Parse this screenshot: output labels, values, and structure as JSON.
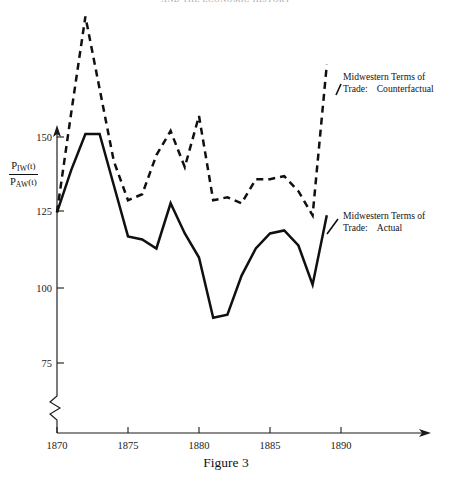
{
  "page": {
    "running_head": "AND THE ECONOMIC HISTORY",
    "caption": "Figure 3"
  },
  "axes": {
    "y_label_numerator_base": "P",
    "y_label_numerator_sub": "IW",
    "y_label_numerator_arg": "(t)",
    "y_label_denominator_base": "P",
    "y_label_denominator_sub": "AW",
    "y_label_denominator_arg": "(t)",
    "y_ticks": [
      150,
      125,
      100,
      75
    ],
    "y_tick_labels": [
      "150",
      "125",
      "100",
      "75"
    ],
    "x_ticks": [
      1870,
      1875,
      1880,
      1885,
      1890
    ],
    "x_tick_labels": [
      "1870",
      "1875",
      "1880",
      "1885",
      "1890"
    ],
    "axis_break": "zigzag"
  },
  "legend": {
    "counterfactual": {
      "line1": "Midwestern Terms of",
      "line2_prefix": "Trade:",
      "line2_value": "Counterfactual"
    },
    "actual": {
      "line1": "Midwestern Terms of",
      "line2_prefix": "Trade:",
      "line2_value": "Actual"
    }
  },
  "colors": {
    "ink": "#101010",
    "background": "#ffffff"
  },
  "chart_data": {
    "type": "line",
    "title": "Figure 3",
    "xlabel": "",
    "ylabel": "P_IW(t) / P_AW(t)",
    "xlim": [
      1870,
      1891
    ],
    "ylim": [
      70,
      195
    ],
    "grid": false,
    "legend_position": "inline-right",
    "x": [
      1870,
      1871,
      1872,
      1873,
      1874,
      1875,
      1876,
      1877,
      1878,
      1879,
      1880,
      1881,
      1882,
      1883,
      1884,
      1885,
      1886,
      1887,
      1888,
      1889
    ],
    "series": [
      {
        "name": "Midwestern Terms of Trade:  Counterfactual",
        "style": "dashed",
        "values": [
          125,
          158,
          190,
          166,
          142,
          129,
          131,
          144,
          152,
          140,
          157,
          129,
          130,
          128,
          136,
          136,
          137,
          132,
          124,
          174
        ]
      },
      {
        "name": "Midwestern Terms of Trade:  Actual",
        "style": "solid",
        "values": [
          125,
          139,
          151,
          151,
          134,
          117,
          116,
          113,
          128,
          118,
          110,
          90,
          91,
          104,
          113,
          118,
          119,
          114,
          101,
          124
        ]
      }
    ]
  }
}
